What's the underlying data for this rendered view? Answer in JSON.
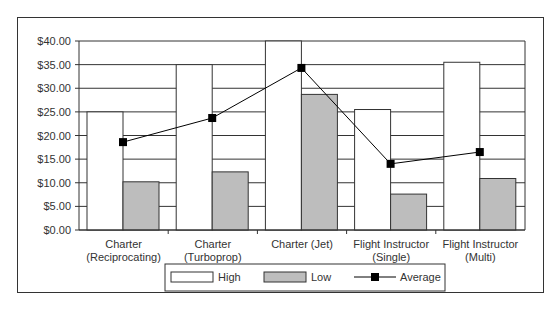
{
  "chart_data": {
    "type": "bar",
    "title": "",
    "xlabel": "",
    "ylabel": "",
    "ylim": [
      0,
      40
    ],
    "yticks": [
      "$0.00",
      "$5.00",
      "$10.00",
      "$15.00",
      "$20.00",
      "$25.00",
      "$30.00",
      "$35.00",
      "$40.00"
    ],
    "grid": true,
    "legend_position": "bottom",
    "categories": [
      [
        "Charter",
        "(Reciprocating)"
      ],
      [
        "Charter",
        "(Turboprop)"
      ],
      [
        "Charter (Jet)"
      ],
      [
        "Flight Instructor",
        "(Single)"
      ],
      [
        "Flight Instructor",
        "(Multi)"
      ]
    ],
    "series": [
      {
        "name": "High",
        "kind": "bar",
        "fill": "#ffffff",
        "values": [
          25,
          35,
          40,
          25.5,
          35.5
        ]
      },
      {
        "name": "Low",
        "kind": "bar",
        "fill": "#bdbdbd",
        "values": [
          10.2,
          12.3,
          28.7,
          7.6,
          10.9
        ]
      },
      {
        "name": "Average",
        "kind": "line",
        "marker": "square",
        "color": "#000000",
        "values": [
          18.6,
          23.7,
          34.3,
          14,
          16.5
        ]
      }
    ]
  },
  "legend": {
    "high": "High",
    "low": "Low",
    "average": "Average"
  },
  "caption": "Figure 7.5"
}
